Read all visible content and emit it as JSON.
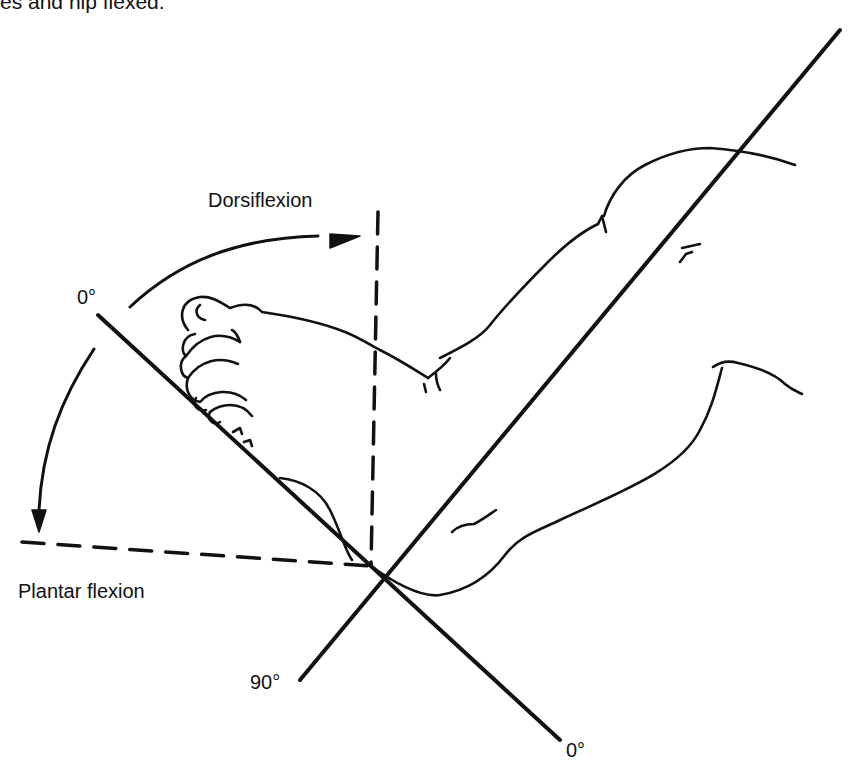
{
  "caption_fragment": "es and hip flexed.",
  "labels": {
    "dorsiflexion": "Dorsiflexion",
    "plantar_flexion": "Plantar flexion",
    "zero_upper": "0°",
    "ninety": "90°",
    "zero_lower": "0°"
  },
  "figure": {
    "stroke_color": "#111111",
    "background": "#ffffff"
  }
}
